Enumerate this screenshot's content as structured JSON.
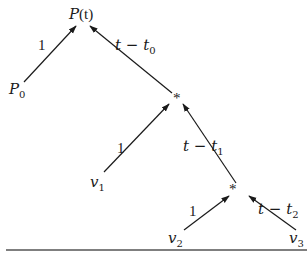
{
  "diagram": {
    "type": "tree",
    "nodes": {
      "root": {
        "label": "P(t)",
        "base": "P",
        "arg": "(t)"
      },
      "p0": {
        "label": "P0",
        "base": "P",
        "sub": "0"
      },
      "star1": {
        "label": "*"
      },
      "v1": {
        "label": "v1",
        "base": "v",
        "sub": "1"
      },
      "star2": {
        "label": "*"
      },
      "v2": {
        "label": "v2",
        "base": "v",
        "sub": "2"
      },
      "v3": {
        "label": "v3",
        "base": "v",
        "sub": "3"
      }
    },
    "edges": [
      {
        "from": "p0",
        "to": "root",
        "label": "1"
      },
      {
        "from": "star1",
        "to": "root",
        "label": "t − t0",
        "text": "t − t",
        "sub": "0"
      },
      {
        "from": "v1",
        "to": "star1",
        "label": "1"
      },
      {
        "from": "star2",
        "to": "star1",
        "label": "t − t1",
        "text": "t − t",
        "sub": "1"
      },
      {
        "from": "v2",
        "to": "star2",
        "label": "1"
      },
      {
        "from": "v3",
        "to": "star2",
        "label": "t − t2",
        "text": "t − t",
        "sub": "2"
      }
    ],
    "colors": {
      "ink": "#1a1a1a",
      "rule": "#555555",
      "background": "#ffffff"
    }
  }
}
